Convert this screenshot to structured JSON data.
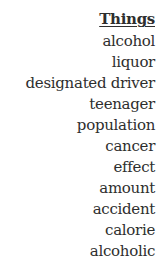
{
  "header": "Things",
  "items": [
    "alcohol",
    "liquor",
    "designated driver",
    "teenager",
    "population",
    "cancer",
    "effect",
    "amount",
    "accident",
    "calorie",
    "alcoholic"
  ]
}
